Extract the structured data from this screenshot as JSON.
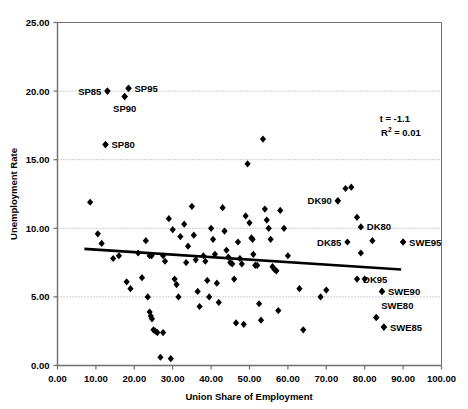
{
  "chart_data": {
    "type": "scatter",
    "title": "",
    "xlabel": "Union Share of Employment",
    "ylabel": "Unemployment Rate",
    "xlim": [
      0,
      100
    ],
    "ylim": [
      0,
      25
    ],
    "xticks": [
      "0.00",
      "10.00",
      "20.00",
      "30.00",
      "40.00",
      "50.00",
      "60.00",
      "70.00",
      "80.00",
      "90.00",
      "100.00"
    ],
    "yticks": [
      "0.00",
      "5.00",
      "10.00",
      "15.00",
      "20.00",
      "25.00"
    ],
    "grid": "horizontal-dotted",
    "legend": "none",
    "marker": "diamond",
    "marker_color": "#000000",
    "points": [
      [
        8.5,
        11.9
      ],
      [
        10.5,
        9.6
      ],
      [
        11.5,
        8.9
      ],
      [
        13.0,
        20.0
      ],
      [
        14.5,
        7.8
      ],
      [
        17.5,
        19.6
      ],
      [
        18.5,
        20.2
      ],
      [
        12.5,
        16.1
      ],
      [
        16.0,
        8.0
      ],
      [
        18.0,
        6.1
      ],
      [
        19.0,
        5.6
      ],
      [
        21.0,
        8.2
      ],
      [
        22.0,
        6.4
      ],
      [
        23.0,
        9.1
      ],
      [
        23.5,
        5.0
      ],
      [
        24.0,
        8.0
      ],
      [
        24.5,
        8.0
      ],
      [
        24.0,
        3.9
      ],
      [
        24.3,
        3.6
      ],
      [
        24.6,
        3.4
      ],
      [
        25.0,
        2.6
      ],
      [
        25.5,
        2.5
      ],
      [
        26.0,
        2.4
      ],
      [
        26.8,
        0.6
      ],
      [
        27.5,
        8.0
      ],
      [
        28.0,
        7.6
      ],
      [
        29.5,
        0.5
      ],
      [
        27.5,
        2.4
      ],
      [
        29.0,
        10.7
      ],
      [
        30.0,
        9.9
      ],
      [
        30.5,
        6.3
      ],
      [
        31.0,
        5.9
      ],
      [
        31.5,
        5.0
      ],
      [
        32.0,
        9.4
      ],
      [
        33.0,
        10.3
      ],
      [
        33.5,
        7.5
      ],
      [
        34.0,
        8.7
      ],
      [
        35.0,
        11.6
      ],
      [
        35.5,
        9.5
      ],
      [
        36.0,
        7.7
      ],
      [
        36.5,
        5.4
      ],
      [
        37.0,
        4.3
      ],
      [
        38.0,
        8.0
      ],
      [
        38.5,
        7.6
      ],
      [
        39.0,
        6.2
      ],
      [
        39.5,
        5.0
      ],
      [
        40.0,
        10.0
      ],
      [
        40.5,
        9.2
      ],
      [
        41.0,
        8.1
      ],
      [
        41.5,
        6.0
      ],
      [
        42.0,
        4.6
      ],
      [
        43.0,
        11.5
      ],
      [
        43.5,
        9.8
      ],
      [
        44.0,
        8.4
      ],
      [
        44.5,
        7.9
      ],
      [
        45.0,
        7.5
      ],
      [
        45.5,
        7.4
      ],
      [
        46.0,
        6.3
      ],
      [
        46.5,
        3.1
      ],
      [
        47.0,
        9.0
      ],
      [
        47.5,
        7.8
      ],
      [
        48.0,
        7.4
      ],
      [
        48.5,
        3.0
      ],
      [
        49.0,
        10.9
      ],
      [
        49.5,
        14.7
      ],
      [
        50.0,
        10.4
      ],
      [
        50.5,
        9.3
      ],
      [
        50.8,
        9.2
      ],
      [
        51.0,
        8.1
      ],
      [
        51.5,
        7.3
      ],
      [
        52.0,
        7.3
      ],
      [
        52.5,
        4.5
      ],
      [
        53.0,
        3.3
      ],
      [
        53.5,
        16.5
      ],
      [
        54.0,
        11.4
      ],
      [
        54.5,
        10.6
      ],
      [
        55.0,
        10.0
      ],
      [
        55.5,
        9.2
      ],
      [
        56.0,
        7.2
      ],
      [
        56.5,
        7.0
      ],
      [
        57.0,
        6.9
      ],
      [
        57.5,
        4.0
      ],
      [
        58.0,
        11.3
      ],
      [
        59.0,
        10.0
      ],
      [
        60.0,
        8.0
      ],
      [
        63.0,
        5.6
      ],
      [
        64.0,
        2.6
      ],
      [
        68.5,
        5.0
      ],
      [
        70.0,
        5.5
      ],
      [
        73.0,
        12.0
      ],
      [
        75.0,
        12.9
      ],
      [
        76.5,
        13.0
      ],
      [
        78.0,
        10.8
      ],
      [
        79.0,
        8.2
      ],
      [
        80.0,
        6.3
      ],
      [
        82.0,
        9.1
      ],
      [
        83.0,
        3.5
      ],
      [
        84.5,
        5.4
      ],
      [
        85.0,
        2.8
      ],
      [
        90.0,
        9.0
      ]
    ],
    "labeled_points": [
      {
        "label": "SP85",
        "x": 13.0,
        "y": 20.0,
        "label_side": "left"
      },
      {
        "label": "SP95",
        "x": 18.5,
        "y": 20.2,
        "label_side": "right"
      },
      {
        "label": "SP90",
        "x": 17.5,
        "y": 19.6,
        "label_side": "below"
      },
      {
        "label": "SP80",
        "x": 12.5,
        "y": 16.1,
        "label_side": "right"
      },
      {
        "label": "DK90",
        "x": 73.0,
        "y": 12.0,
        "label_side": "left"
      },
      {
        "label": "DK80",
        "x": 79.0,
        "y": 10.1,
        "label_side": "right"
      },
      {
        "label": "DK85",
        "x": 75.5,
        "y": 9.0,
        "label_side": "left"
      },
      {
        "label": "SWE95",
        "x": 90.0,
        "y": 9.0,
        "label_side": "right"
      },
      {
        "label": "DK95",
        "x": 78.0,
        "y": 6.3,
        "label_side": "right"
      },
      {
        "label": "SWE90",
        "x": 84.5,
        "y": 5.4,
        "label_side": "right"
      },
      {
        "label": "SWE80",
        "x": 83.0,
        "y": 3.5,
        "label_side": "above"
      },
      {
        "label": "SWE85",
        "x": 85.0,
        "y": 2.8,
        "label_side": "right"
      }
    ],
    "trendline": {
      "x_start": 7.0,
      "y_start": 8.5,
      "x_end": 89.5,
      "y_end": 7.0
    },
    "annotations": {
      "t_stat": "t = -1.1",
      "r_squared_prefix": "R",
      "r_squared_sup": "2",
      "r_squared_value": " = 0.01"
    }
  }
}
